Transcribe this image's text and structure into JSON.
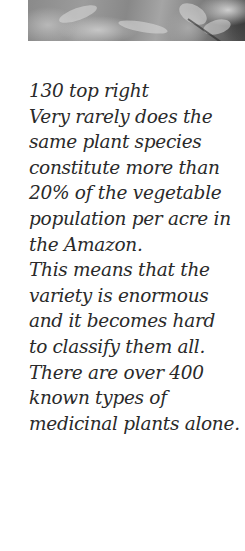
{
  "photo": {
    "alt": "plant close-up"
  },
  "caption": {
    "lines": [
      "130 top right",
      "Very rarely does the",
      "same plant species",
      "constitute more than",
      "20% of the vegetable",
      "population per acre in",
      "the Amazon.",
      "This means that the",
      "variety is enormous",
      "and it becomes hard",
      "to classify them all.",
      "There are over 400",
      "known types of",
      "medicinal plants alone."
    ]
  }
}
